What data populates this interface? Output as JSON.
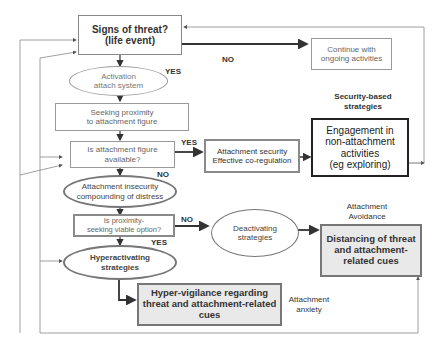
{
  "nodes": {
    "signs_of_threat": {
      "line1": "Signs of threat?",
      "line2": "(life event)"
    },
    "continue": {
      "line1": "Continue with",
      "line2": "ongoing activities"
    },
    "activation": {
      "line1": "Activation",
      "line2": "attach system"
    },
    "seeking": {
      "line1": "Seeking proximity",
      "line2": "to attachment figure"
    },
    "available": {
      "line1": "Is attachment figure",
      "line2": "available?"
    },
    "security": {
      "line1": "Attachment security",
      "line2": "Effective co-regulation"
    },
    "engagement": {
      "line1": "Engagement in",
      "line2": "non-attachment",
      "line3": "activities",
      "line4": "(eg exploring)"
    },
    "insecurity": {
      "line1": "Attachment insecurity",
      "line2": "compounding of distress"
    },
    "viable": {
      "line1": "Is proximity-",
      "line2": "seeking viable option?"
    },
    "deactivating": {
      "line1": "Deactivating",
      "line2": "strategies"
    },
    "distancing": {
      "line1": "Distancing of threat",
      "line2": "and attachment-",
      "line3": "related cues"
    },
    "hyperactivating": {
      "line1": "Hyperactivating",
      "line2": "strategies"
    },
    "hypervigilance": {
      "line1": "Hyper-vigilance regarding",
      "line2": "threat and attachment-related",
      "line3": "cues"
    }
  },
  "edge_labels": {
    "no_threat": "NO",
    "yes_activation": "YES",
    "yes_available": "YES",
    "no_available": "NO",
    "no_viable": "NO",
    "yes_viable": "YES"
  },
  "captions": {
    "security_based": {
      "line1": "Security-based",
      "line2": "strategies"
    },
    "avoidance": {
      "line1": "Attachment",
      "line2": "Avoidance"
    },
    "anxiety": {
      "line1": "Attachment",
      "line2": "anxiety"
    }
  }
}
